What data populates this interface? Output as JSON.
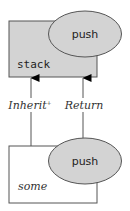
{
  "diagram": {
    "nodes": [
      {
        "id": "stack",
        "label": "stack",
        "kind": "class-box",
        "fill": "#d3d3d3",
        "method": {
          "label": "push",
          "fill": "#d3d3d3"
        }
      },
      {
        "id": "some",
        "label": "some",
        "kind": "class-box",
        "fill": "#ffffff",
        "method": {
          "label": "push",
          "fill": "#d3d3d3"
        }
      }
    ],
    "edges": [
      {
        "from": "some",
        "to": "stack",
        "label": "Inherit",
        "superscript": "+"
      },
      {
        "from": "some.push",
        "to": "stack",
        "label": "Return"
      }
    ],
    "colors": {
      "stroke": "#555555",
      "gray_fill": "#d3d3d3",
      "white_fill": "#ffffff",
      "arrowhead": "#000000"
    }
  }
}
